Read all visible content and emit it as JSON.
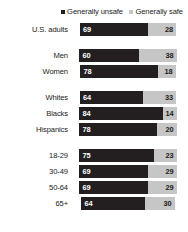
{
  "legend": {
    "items": [
      {
        "label": "Generally unsafe",
        "color": "#231f20",
        "icon": "square-swatch-icon"
      },
      {
        "label": "Generally safe",
        "color": "#c6c6c6",
        "icon": "square-swatch-icon"
      }
    ]
  },
  "chart_data": {
    "type": "bar",
    "orientation": "horizontal",
    "stacked": true,
    "centered": true,
    "title": "",
    "subtitle": "",
    "xlabel": "",
    "ylabel": "",
    "xlim": [
      0,
      100
    ],
    "grid": false,
    "legend_position": "top-right",
    "categories": [
      "U.S. adults",
      "Men",
      "Women",
      "Whites",
      "Blacks",
      "Hispanics",
      "18-29",
      "30-49",
      "50-64",
      "65+"
    ],
    "series": [
      {
        "name": "Generally unsafe",
        "color": "#231f20",
        "values": [
          69,
          60,
          78,
          64,
          84,
          78,
          75,
          69,
          69,
          64
        ]
      },
      {
        "name": "Generally safe",
        "color": "#c6c6c6",
        "values": [
          28,
          38,
          18,
          33,
          14,
          20,
          23,
          29,
          29,
          30
        ]
      }
    ],
    "groups": [
      {
        "name": "total",
        "categories": [
          "U.S. adults"
        ]
      },
      {
        "name": "gender",
        "categories": [
          "Men",
          "Women"
        ]
      },
      {
        "name": "race",
        "categories": [
          "Whites",
          "Blacks",
          "Hispanics"
        ]
      },
      {
        "name": "age",
        "categories": [
          "18-29",
          "30-49",
          "50-64",
          "65+"
        ]
      }
    ]
  },
  "rows": [
    {
      "label": "U.S. adults",
      "unsafe": 69,
      "safe": 28,
      "gap_after": true
    },
    {
      "label": "Men",
      "unsafe": 60,
      "safe": 38,
      "gap_after": false
    },
    {
      "label": "Women",
      "unsafe": 78,
      "safe": 18,
      "gap_after": true
    },
    {
      "label": "Whites",
      "unsafe": 64,
      "safe": 33,
      "gap_after": false
    },
    {
      "label": "Blacks",
      "unsafe": 84,
      "safe": 14,
      "gap_after": false
    },
    {
      "label": "Hispanics",
      "unsafe": 78,
      "safe": 20,
      "gap_after": true
    },
    {
      "label": "18-29",
      "unsafe": 75,
      "safe": 23,
      "gap_after": false
    },
    {
      "label": "30-49",
      "unsafe": 69,
      "safe": 29,
      "gap_after": false
    },
    {
      "label": "50-64",
      "unsafe": 69,
      "safe": 29,
      "gap_after": false
    },
    {
      "label": "65+",
      "unsafe": 64,
      "safe": 30,
      "gap_after": false
    }
  ],
  "colors": {
    "unsafe": "#231f20",
    "safe": "#c6c6c6",
    "background": "#ffffff",
    "text": "#1a1a1a",
    "value_on_dark": "#ffffff"
  }
}
